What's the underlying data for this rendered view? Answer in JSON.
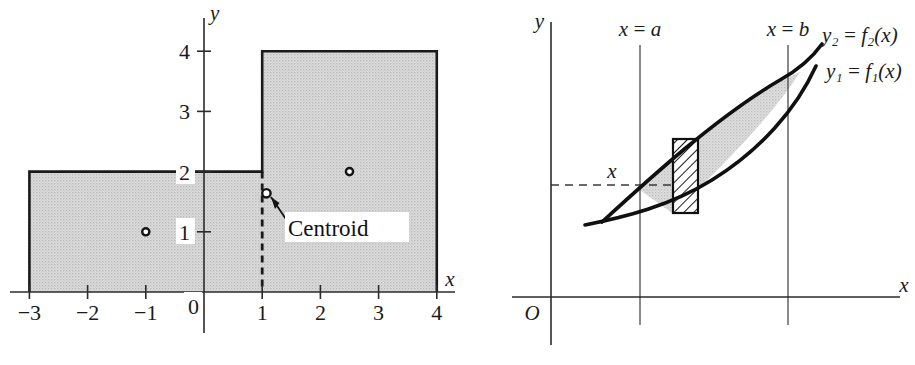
{
  "figures": {
    "left": {
      "name": "composite-region-centroid-figure",
      "axis_labels": {
        "x": "x",
        "y": "y",
        "origin": "0"
      },
      "x_ticks": [
        {
          "value": -3,
          "label": "−3"
        },
        {
          "value": -2,
          "label": "−2"
        },
        {
          "value": -1,
          "label": "−1"
        },
        {
          "value": 1,
          "label": "1"
        },
        {
          "value": 2,
          "label": "2"
        },
        {
          "value": 3,
          "label": "3"
        },
        {
          "value": 4,
          "label": "4"
        }
      ],
      "y_ticks": [
        {
          "value": 1,
          "label": "1"
        },
        {
          "value": 2,
          "label": "2"
        },
        {
          "value": 3,
          "label": "3"
        },
        {
          "value": 4,
          "label": "4"
        }
      ],
      "region": {
        "fill_color": "#d6d6d6",
        "outline_color": "#1a1a1a",
        "vertices": [
          [
            -3,
            0
          ],
          [
            -3,
            2
          ],
          [
            1,
            2
          ],
          [
            1,
            4
          ],
          [
            4,
            4
          ],
          [
            4,
            0
          ]
        ],
        "parts": [
          {
            "name": "left-rectangle",
            "x_range": [
              -3,
              1
            ],
            "y_range": [
              0,
              2
            ],
            "centroid": [
              -1,
              1
            ]
          },
          {
            "name": "right-rectangle",
            "x_range": [
              1,
              4
            ],
            "y_range": [
              0,
              4
            ],
            "centroid": [
              2.5,
              2
            ]
          }
        ],
        "divider_x": 1
      },
      "markers": [
        {
          "name": "left-part-centroid",
          "x": -1,
          "y": 1
        },
        {
          "name": "right-part-centroid",
          "x": 2.5,
          "y": 2
        },
        {
          "name": "composite-centroid",
          "x": 1.07,
          "y": 1.64
        }
      ],
      "annotation": {
        "label": "Centroid",
        "points_to": [
          1.07,
          1.64
        ]
      }
    },
    "right": {
      "name": "area-between-curves-figure",
      "axis_labels": {
        "x": "x",
        "y": "y",
        "origin": "O"
      },
      "vertical_lines": [
        {
          "name": "x-equals-a",
          "label": "x = a"
        },
        {
          "name": "x-equals-b",
          "label": "x = b"
        }
      ],
      "curve_labels": [
        {
          "name": "upper-curve-label",
          "text": "y₂ = f₂(x)"
        },
        {
          "name": "lower-curve-label",
          "text": "y₁ = f₁(x)"
        }
      ],
      "strip_label": "x",
      "region": {
        "fill_color": "#d9d9d9",
        "outline_color": "#101010",
        "description": "lens-shaped region between two curves"
      },
      "element_strip": {
        "name": "vertical-element-strip",
        "hatch_color": "#1a1a1a",
        "fill_color": "#ffffff"
      }
    }
  },
  "colors": {
    "ink": "#1a1a1a",
    "shade": "#d6d6d6",
    "paper": "#ffffff",
    "thin_rule": "#4a4a4a"
  }
}
